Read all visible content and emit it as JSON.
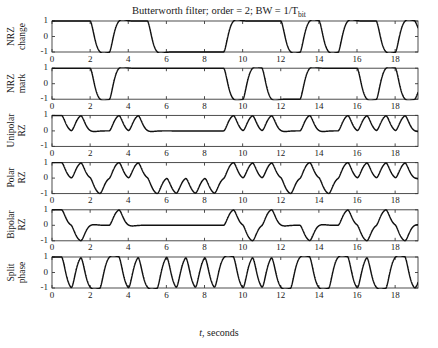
{
  "figure": {
    "title_prefix": "Butterworth filter; order = 2; BW = 1/T",
    "title_sub": "bit",
    "title_full": "Butterworth filter; order = 2; BW = 1/Tbit",
    "xlabel_italic": "t",
    "xlabel_rest": ", seconds",
    "background_color": "#ffffff",
    "trace_color": "#111111",
    "axis_color": "#3a3a3a"
  },
  "chart_data": {
    "type": "line",
    "title": "Butterworth filter; order = 2; BW = 1/Tbit",
    "xlabel": "t, seconds",
    "ylabel": "",
    "grid": false,
    "legend": "none",
    "xlim": [
      0,
      19.2
    ],
    "xticks": [
      0,
      2,
      4,
      6,
      8,
      10,
      12,
      14,
      16,
      18
    ],
    "xtick_labels": [
      "0",
      "2",
      "4",
      "6",
      "8",
      "10",
      "12",
      "14",
      "16",
      "18"
    ],
    "bit_rate_bits_per_second": 1,
    "bit_sequence": [
      1,
      1,
      0,
      1,
      1,
      0,
      0,
      0,
      0,
      1,
      1,
      1,
      0,
      1,
      0,
      1,
      1,
      0,
      1
    ],
    "subplots": [
      {
        "index": 0,
        "ylabel": "NRZ\nchange",
        "ylabel_line1": "NRZ",
        "ylabel_line2": "change",
        "ylim": [
          -1,
          1
        ],
        "yticks": [
          -1,
          0,
          1
        ],
        "ytick_labels": [
          "-1",
          "0",
          "1"
        ],
        "code": "nrz-change",
        "levels": [
          1,
          1,
          -1,
          1,
          1,
          -1,
          -1,
          -1,
          -1,
          1,
          1,
          1,
          -1,
          1,
          -1,
          1,
          1,
          -1,
          1
        ]
      },
      {
        "index": 1,
        "ylabel": "NRZ\nmark",
        "ylabel_line1": "NRZ",
        "ylabel_line2": "mark",
        "ylim": [
          -1,
          1
        ],
        "yticks": [
          -1,
          0,
          1
        ],
        "ytick_labels": [
          "-1",
          "0",
          "1"
        ],
        "code": "nrz-mark",
        "levels": [
          1,
          1,
          -1,
          1,
          1,
          1,
          1,
          1,
          1,
          -1,
          1,
          -1,
          -1,
          1,
          1,
          1,
          -1,
          1,
          -1
        ]
      },
      {
        "index": 2,
        "ylabel": "Unipolar\nRZ",
        "ylabel_line1": "Unipolar",
        "ylabel_line2": "RZ",
        "ylim": [
          -1,
          1
        ],
        "yticks": [
          -1,
          0,
          1
        ],
        "ytick_labels": [
          "-1",
          "0",
          "1"
        ],
        "code": "unipolar-rz",
        "levels": [
          1,
          1,
          0,
          1,
          1,
          0,
          0,
          0,
          0,
          1,
          1,
          1,
          0,
          1,
          0,
          1,
          1,
          1,
          1
        ]
      },
      {
        "index": 3,
        "ylabel": "Polar\nRZ",
        "ylabel_line1": "Polar",
        "ylabel_line2": "RZ",
        "ylim": [
          -1,
          1
        ],
        "yticks": [
          -1,
          0,
          1
        ],
        "ytick_labels": [
          "-1",
          "0",
          "1"
        ],
        "code": "polar-rz",
        "levels": [
          1,
          1,
          -1,
          1,
          1,
          -1,
          -1,
          -1,
          -1,
          1,
          1,
          1,
          -1,
          1,
          -1,
          1,
          1,
          1,
          1
        ]
      },
      {
        "index": 4,
        "ylabel": "Bipolar\nRZ",
        "ylabel_line1": "Bipolar",
        "ylabel_line2": "RZ",
        "ylim": [
          -1,
          1
        ],
        "yticks": [
          -1,
          0,
          1
        ],
        "ytick_labels": [
          "-1",
          "0",
          "1"
        ],
        "code": "bipolar-rz",
        "levels": [
          1,
          -1,
          0,
          1,
          0,
          0,
          0,
          0,
          0,
          1,
          -1,
          1,
          0,
          -1,
          0,
          1,
          -1,
          1,
          -1
        ]
      },
      {
        "index": 5,
        "ylabel": "Split\nphase",
        "ylabel_line1": "Split",
        "ylabel_line2": "phase",
        "ylim": [
          -1,
          1
        ],
        "yticks": [
          -1,
          0,
          1
        ],
        "ytick_labels": [
          "-1",
          "0",
          "1"
        ],
        "code": "split-phase",
        "levels": [
          1,
          1,
          -1,
          1,
          1,
          -1,
          -1,
          -1,
          -1,
          1,
          1,
          1,
          -1,
          1,
          -1,
          1,
          1,
          -1,
          1
        ]
      }
    ]
  }
}
